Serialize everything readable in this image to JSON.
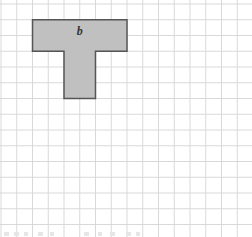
{
  "diagram": {
    "type": "grid-shape",
    "grid": {
      "cell_size_px": 15.75,
      "origin_x": 1,
      "origin_y": 4,
      "columns": 16,
      "rows": 15,
      "line_color": "#d9d9d9"
    },
    "shape": {
      "name": "T-shape",
      "label": "b",
      "fill_color": "#c0c0c0",
      "stroke_color": "#555555",
      "cells_description": "Top bar 6 units wide x 2 units tall; stem 2 units wide x 3 units tall centered under columns 3-4 of the bar",
      "points_grid_units": [
        [
          2,
          1
        ],
        [
          8,
          1
        ],
        [
          8,
          3
        ],
        [
          6,
          3
        ],
        [
          6,
          6
        ],
        [
          4,
          6
        ],
        [
          4,
          3
        ],
        [
          2,
          3
        ]
      ]
    },
    "footer_fragments_note": "faint cut-off text at bottom edge"
  }
}
